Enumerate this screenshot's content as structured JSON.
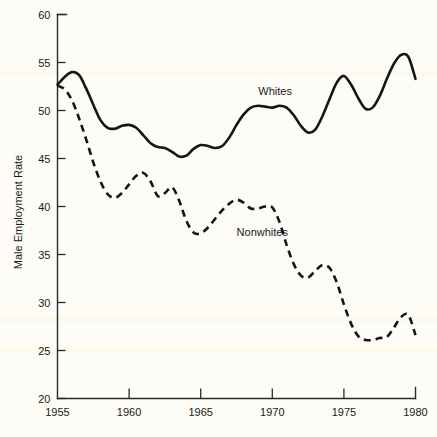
{
  "chart_data": {
    "type": "line",
    "title": "",
    "xlabel": "",
    "ylabel": "Male Employment Rate",
    "xlim": [
      1955,
      1980
    ],
    "ylim": [
      20,
      60
    ],
    "xticks": [
      1955,
      1960,
      1965,
      1970,
      1975,
      1980
    ],
    "yticks": [
      20,
      25,
      30,
      35,
      40,
      45,
      50,
      55,
      60
    ],
    "grid": false,
    "legend_position": "inline-annotation",
    "series": [
      {
        "name": "Whites",
        "style": "solid",
        "color": "#151515",
        "label_x": 1970.2,
        "label_y": 51.6,
        "x": [
          1955.0,
          1955.5,
          1956.0,
          1956.5,
          1957.0,
          1957.5,
          1958.0,
          1958.5,
          1959.0,
          1959.5,
          1960.0,
          1960.5,
          1961.0,
          1961.5,
          1962.0,
          1962.5,
          1963.0,
          1963.5,
          1964.0,
          1964.5,
          1965.0,
          1965.5,
          1966.0,
          1966.5,
          1967.0,
          1967.5,
          1968.0,
          1968.5,
          1969.0,
          1969.5,
          1970.0,
          1970.5,
          1971.0,
          1971.5,
          1972.0,
          1972.5,
          1973.0,
          1973.5,
          1974.0,
          1974.5,
          1975.0,
          1975.5,
          1976.0,
          1976.5,
          1977.0,
          1977.5,
          1978.0,
          1978.5,
          1979.0,
          1979.5,
          1980.0
        ],
        "y": [
          52.7,
          53.5,
          54.0,
          53.7,
          52.3,
          50.6,
          49.0,
          48.2,
          48.1,
          48.4,
          48.5,
          48.2,
          47.4,
          46.6,
          46.2,
          46.1,
          45.7,
          45.2,
          45.3,
          46.0,
          46.4,
          46.3,
          46.1,
          46.3,
          47.2,
          48.5,
          49.6,
          50.3,
          50.5,
          50.4,
          50.3,
          50.5,
          50.3,
          49.5,
          48.4,
          47.7,
          48.0,
          49.4,
          51.2,
          52.9,
          53.6,
          52.7,
          51.3,
          50.2,
          50.3,
          51.5,
          53.3,
          54.9,
          55.8,
          55.6,
          53.3
        ]
      },
      {
        "name": "Nonwhites",
        "style": "dashed",
        "color": "#151515",
        "label_x": 1969.3,
        "label_y": 36.9,
        "x": [
          1955.0,
          1955.5,
          1956.0,
          1956.5,
          1957.0,
          1957.5,
          1958.0,
          1958.5,
          1959.0,
          1959.5,
          1960.0,
          1960.5,
          1961.0,
          1961.5,
          1962.0,
          1962.5,
          1963.0,
          1963.5,
          1964.0,
          1964.5,
          1965.0,
          1965.5,
          1966.0,
          1966.5,
          1967.0,
          1967.5,
          1968.0,
          1968.5,
          1969.0,
          1969.5,
          1970.0,
          1970.5,
          1971.0,
          1971.5,
          1972.0,
          1972.5,
          1973.0,
          1973.5,
          1974.0,
          1974.5,
          1975.0,
          1975.5,
          1976.0,
          1976.5,
          1977.0,
          1977.5,
          1978.0,
          1978.5,
          1979.0,
          1979.5,
          1980.0
        ],
        "y": [
          52.6,
          52.2,
          51.1,
          49.2,
          47.0,
          44.6,
          42.6,
          41.3,
          40.9,
          41.4,
          42.3,
          43.2,
          43.5,
          42.6,
          41.1,
          41.4,
          42.0,
          40.6,
          38.5,
          37.3,
          37.2,
          37.8,
          38.7,
          39.6,
          40.3,
          40.7,
          40.4,
          39.8,
          39.8,
          40.0,
          39.9,
          38.4,
          36.0,
          34.0,
          32.8,
          32.6,
          33.3,
          33.9,
          33.6,
          32.1,
          29.8,
          27.8,
          26.5,
          26.1,
          26.1,
          26.3,
          26.4,
          27.4,
          28.5,
          28.7,
          26.6
        ]
      }
    ]
  },
  "axis": {
    "ylabel": "Male Employment Rate",
    "ytick_labels": [
      "60",
      "55",
      "50",
      "45",
      "40",
      "35",
      "30",
      "25",
      "20"
    ],
    "xtick_labels": [
      "1955",
      "1960",
      "1965",
      "1970",
      "1975",
      "1980"
    ]
  },
  "annotations": {
    "whites_label": "Whites",
    "nonwhites_label": "Nonwhites"
  },
  "colors": {
    "background": "#fdfcf6",
    "line": "#151515",
    "axis": "#2a2a2a"
  }
}
